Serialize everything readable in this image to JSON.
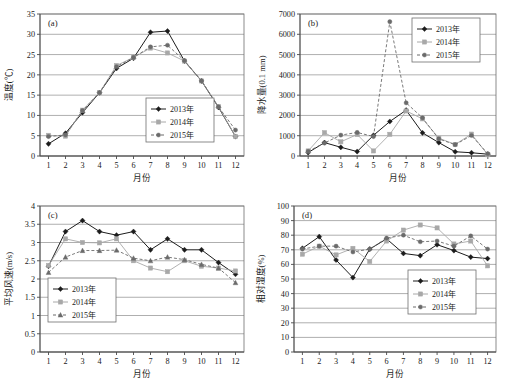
{
  "figure": {
    "xlabel": "月份",
    "months": [
      "1",
      "2",
      "3",
      "4",
      "5",
      "6",
      "7",
      "8",
      "9",
      "10",
      "11",
      "12"
    ],
    "series_names": [
      "2013年",
      "2014年",
      "2015年"
    ],
    "colors": {
      "s2013": "#1c1c1c",
      "s2014": "#a8a8a8",
      "s2015": "#6b6b6b",
      "grid": "#8c8c8c",
      "frame": "#6f6f6f"
    }
  },
  "chart_data": [
    {
      "type": "line",
      "panel": "a",
      "tag": "(a)",
      "title": "",
      "xlabel": "月份",
      "ylabel": "温度(℃)",
      "categories": [
        "1",
        "2",
        "3",
        "4",
        "5",
        "6",
        "7",
        "8",
        "9",
        "10",
        "11",
        "12"
      ],
      "ylim": [
        0,
        35
      ],
      "yticks": [
        0,
        5,
        10,
        15,
        20,
        25,
        30,
        35
      ],
      "grid": true,
      "legend_position": "center",
      "series": [
        {
          "name": "2013年",
          "marker": "diamond",
          "dash": "solid",
          "color": "#1c1c1c",
          "values": [
            3.0,
            5.6,
            10.7,
            15.6,
            21.6,
            24.1,
            30.5,
            30.8,
            23.4,
            18.5,
            12.0,
            4.8
          ]
        },
        {
          "name": "2014年",
          "marker": "square",
          "dash": "solid",
          "color": "#a8a8a8",
          "values": [
            5.1,
            4.9,
            11.3,
            15.6,
            22.3,
            24.3,
            26.6,
            25.4,
            23.4,
            18.5,
            12.2,
            4.8
          ]
        },
        {
          "name": "2015年",
          "marker": "circle",
          "dash": "dashed",
          "color": "#6b6b6b",
          "values": [
            4.8,
            5.2,
            11.2,
            15.6,
            22.0,
            24.3,
            26.9,
            27.3,
            23.5,
            18.5,
            12.1,
            6.4
          ]
        }
      ]
    },
    {
      "type": "line",
      "panel": "b",
      "tag": "(b)",
      "title": "",
      "xlabel": "月份",
      "ylabel": "降水量(0.1 mm)",
      "categories": [
        "1",
        "2",
        "3",
        "4",
        "5",
        "6",
        "7",
        "8",
        "9",
        "10",
        "11",
        "12"
      ],
      "ylim": [
        0,
        7000
      ],
      "yticks": [
        0,
        1000,
        2000,
        3000,
        4000,
        5000,
        6000,
        7000
      ],
      "grid": true,
      "legend_position": "top-right",
      "series": [
        {
          "name": "2013年",
          "marker": "diamond",
          "dash": "solid",
          "color": "#1c1c1c",
          "values": [
            170,
            660,
            430,
            220,
            1020,
            1700,
            2260,
            1140,
            660,
            210,
            160,
            90
          ]
        },
        {
          "name": "2014年",
          "marker": "square",
          "dash": "solid",
          "color": "#a8a8a8",
          "values": [
            250,
            1150,
            700,
            1060,
            250,
            1070,
            2220,
            1830,
            880,
            570,
            1080,
            60
          ]
        },
        {
          "name": "2015年",
          "marker": "circle",
          "dash": "dashed",
          "color": "#6b6b6b",
          "values": [
            230,
            640,
            1030,
            1160,
            960,
            6620,
            2620,
            1880,
            840,
            560,
            1010,
            110
          ]
        }
      ]
    },
    {
      "type": "line",
      "panel": "c",
      "tag": "(c)",
      "title": "",
      "xlabel": "月份",
      "ylabel": "平均风速(m/s)",
      "categories": [
        "1",
        "2",
        "3",
        "4",
        "5",
        "6",
        "7",
        "8",
        "9",
        "10",
        "11",
        "12"
      ],
      "ylim": [
        0,
        4
      ],
      "yticks": [
        0,
        0.5,
        1,
        1.5,
        2,
        2.5,
        3,
        3.5,
        4
      ],
      "ytick_labels": [
        "0",
        "0.5",
        "1",
        "1.5",
        "2",
        "2.5",
        "3",
        "3.5",
        "4"
      ],
      "grid": true,
      "legend_position": "bottom-left",
      "series": [
        {
          "name": "2013年",
          "marker": "diamond",
          "dash": "solid",
          "color": "#1c1c1c",
          "values": [
            2.35,
            3.3,
            3.6,
            3.3,
            3.2,
            3.3,
            2.8,
            3.1,
            2.8,
            2.8,
            2.45,
            2.13
          ]
        },
        {
          "name": "2014年",
          "marker": "square",
          "dash": "solid",
          "color": "#a8a8a8",
          "values": [
            2.37,
            3.1,
            3.0,
            2.99,
            3.1,
            2.5,
            2.3,
            2.2,
            2.5,
            2.35,
            2.3,
            2.22
          ]
        },
        {
          "name": "2015年",
          "marker": "triangle",
          "dash": "dashed",
          "color": "#6b6b6b",
          "values": [
            2.18,
            2.6,
            2.78,
            2.78,
            2.79,
            2.57,
            2.5,
            2.6,
            2.53,
            2.4,
            2.3,
            1.9
          ]
        }
      ]
    },
    {
      "type": "line",
      "panel": "d",
      "tag": "(d)",
      "title": "",
      "xlabel": "月份",
      "ylabel": "相对湿度(%)",
      "categories": [
        "1",
        "2",
        "3",
        "4",
        "5",
        "6",
        "7",
        "8",
        "9",
        "10",
        "11",
        "12"
      ],
      "ylim": [
        0,
        100
      ],
      "yticks": [
        0,
        10,
        20,
        30,
        40,
        50,
        60,
        70,
        80,
        90,
        100
      ],
      "grid": true,
      "legend_position": "bottom-right",
      "series": [
        {
          "name": "2013年",
          "marker": "diamond",
          "dash": "solid",
          "color": "#1c1c1c",
          "values": [
            71,
            79,
            63,
            51,
            70.5,
            77.5,
            67.5,
            66,
            73.5,
            69.5,
            65,
            64
          ]
        },
        {
          "name": "2014年",
          "marker": "square",
          "dash": "solid",
          "color": "#a8a8a8",
          "values": [
            67,
            72.5,
            66.5,
            71,
            62,
            76,
            83.5,
            87,
            85,
            74,
            76,
            59
          ]
        },
        {
          "name": "2015年",
          "marker": "circle",
          "dash": "dashed",
          "color": "#6b6b6b",
          "values": [
            70.5,
            72.5,
            72.5,
            68.5,
            70.5,
            78,
            80,
            75.5,
            76,
            72.5,
            79.5,
            70.5
          ]
        }
      ]
    }
  ]
}
